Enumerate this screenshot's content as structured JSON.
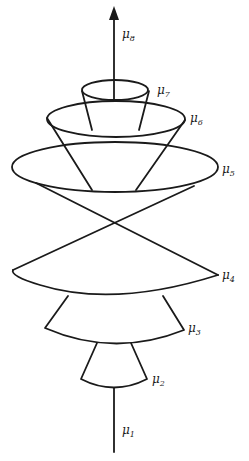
{
  "diagram": {
    "type": "stacked-cones",
    "axis": {
      "direction": "up",
      "arrow": true
    },
    "labels": [
      {
        "id": "mu1",
        "symbol": "μ",
        "sub": "1"
      },
      {
        "id": "mu2",
        "symbol": "μ",
        "sub": "2"
      },
      {
        "id": "mu3",
        "symbol": "μ",
        "sub": "3"
      },
      {
        "id": "mu4",
        "symbol": "μ",
        "sub": "4"
      },
      {
        "id": "mu5",
        "symbol": "μ",
        "sub": "5"
      },
      {
        "id": "mu6",
        "symbol": "μ",
        "sub": "6"
      },
      {
        "id": "mu7",
        "symbol": "μ",
        "sub": "7"
      },
      {
        "id": "mu8",
        "symbol": "μ",
        "sub": "8"
      }
    ]
  }
}
